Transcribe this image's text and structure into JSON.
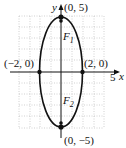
{
  "figure": {
    "type": "ellipse-diagram",
    "axes": {
      "x_label": "x",
      "y_label": "y",
      "x_tick_label": "5"
    },
    "points": [
      {
        "name": "top-vertex",
        "label": "(0, 5)",
        "x": 0,
        "y": 5
      },
      {
        "name": "bottom-vertex",
        "label": "(0, −5)",
        "x": 0,
        "y": -5
      },
      {
        "name": "left-covertex",
        "label": "(−2, 0)",
        "x": -2,
        "y": 0
      },
      {
        "name": "right-covertex",
        "label": "(2, 0)",
        "x": 2,
        "y": 0
      }
    ],
    "foci": [
      {
        "name": "F1",
        "letter": "F",
        "sub": "1"
      },
      {
        "name": "F2",
        "letter": "F",
        "sub": "2"
      }
    ],
    "colors": {
      "curve": "#111111",
      "grid": "#b8b8b8",
      "axis": "#111111"
    }
  }
}
